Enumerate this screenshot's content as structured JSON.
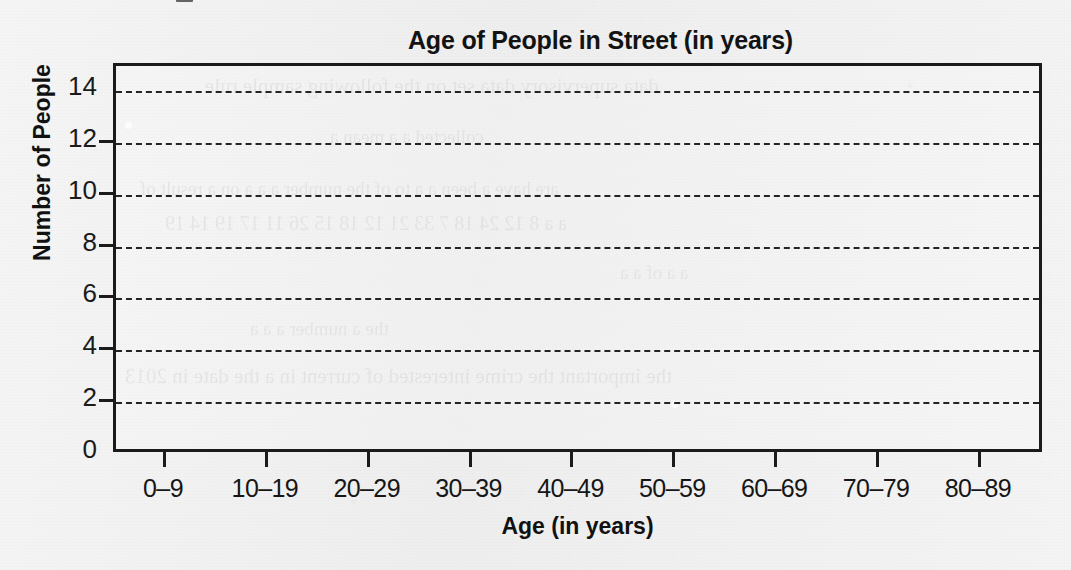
{
  "document": {
    "kind": "worksheet-bar-chart-template",
    "paper_color": "#f1f1f1",
    "ink_color": "#1b1b1b"
  },
  "chart_data": {
    "type": "bar",
    "title": "Age of People in Street (in years)",
    "xlabel": "Age (in years)",
    "ylabel": "Number of People",
    "categories": [
      "0–9",
      "10–19",
      "20–29",
      "30–39",
      "40–49",
      "50–59",
      "60–69",
      "70–79",
      "80–89"
    ],
    "values": [
      null,
      null,
      null,
      null,
      null,
      null,
      null,
      null,
      null
    ],
    "ylim": [
      0,
      15
    ],
    "yticks": [
      0,
      2,
      4,
      6,
      8,
      10,
      12,
      14
    ],
    "ytick_labels": [
      "0",
      "2",
      "4",
      "6",
      "8",
      "10",
      "12",
      "14"
    ],
    "grid": "horizontal-dashed",
    "legend": null,
    "note": "Plot area is empty — blank grid provided for the reader to draw the bars."
  },
  "ghost_text": {
    "note": "faint show-through from the reverse side of the page, largely illegible",
    "lines": [
      "data supervisory data set on the following sample rule",
      "collected a a mean a",
      "are have a been a a to of the number a a a on a result of",
      "a a 8 12 24 18 7 33 21 12 18 15 26 11 17 19 14 19",
      "a a of a a",
      "the a number a a a",
      "the important the crime interested of current in a the date in 2013"
    ]
  }
}
